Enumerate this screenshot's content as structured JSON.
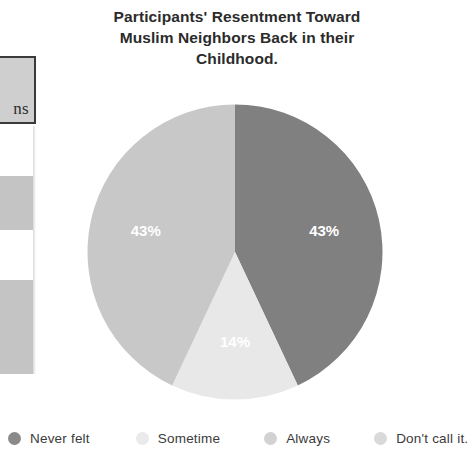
{
  "chart_data": {
    "type": "pie",
    "title": "Participants' Resentment Toward Muslim Neighbors Back in their Childhood.",
    "title_lines": [
      "Participants' Resentment Toward",
      "Muslim Neighbors Back in their",
      "Childhood."
    ],
    "categories": [
      "Never felt",
      "Sometime",
      "Always",
      "Don't call it."
    ],
    "values": [
      43,
      14,
      43,
      0
    ],
    "value_labels": [
      "43%",
      "14%",
      "43%",
      ""
    ],
    "visible_slices": [
      {
        "name": "Never felt",
        "value": 43,
        "label": "43%",
        "color": "#808080"
      },
      {
        "name": "Sometime",
        "value": 14,
        "label": "14%",
        "color": "#e8e8e8"
      },
      {
        "name": "Always",
        "value": 43,
        "label": "43%",
        "color": "#c8c8c8"
      }
    ],
    "legend_position": "bottom",
    "colors": {
      "never_felt": "#808080",
      "sometime": "#e8e8e8",
      "always": "#c8c8c8",
      "dont_call_it": "#d9d9d9"
    },
    "label_color": "#ffffff",
    "start_angle_deg": 0,
    "direction": "clockwise"
  },
  "legend": {
    "items": [
      {
        "label": "Never felt",
        "color": "#8a8a8a"
      },
      {
        "label": "Sometime",
        "color": "#eaeaea"
      },
      {
        "label": "Always",
        "color": "#d2d2d2"
      },
      {
        "label": "Don't call it.",
        "color": "#d9d9d9"
      }
    ]
  },
  "slice_labels": {
    "right": "43%",
    "left": "43%",
    "bottom": "14%"
  },
  "table_fragment": {
    "header_text": "ns"
  }
}
